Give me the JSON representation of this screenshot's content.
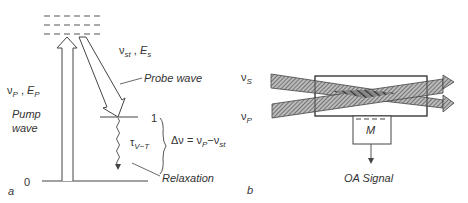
{
  "panel_a": {
    "panel_label": "a",
    "level_0": "0",
    "level_1": "1",
    "pump_symbol": "ν",
    "pump_symbol_sub": "P",
    "pump_energy": "E",
    "pump_energy_sub": "P",
    "pump_label_line1": "Pump",
    "pump_label_line2": "wave",
    "stokes_symbol": "ν",
    "stokes_symbol_sub": "st",
    "stokes_energy": "E",
    "stokes_energy_sub": "s",
    "probe_label": "Probe wave",
    "tau": "τ",
    "tau_sub": "V−T",
    "delta_nu": "Δν = ν",
    "delta_nu_sub1": "P",
    "delta_nu_mid": "−ν",
    "delta_nu_sub2": "st",
    "relaxation_label": "Relaxation"
  },
  "panel_b": {
    "panel_label": "b",
    "beam_s": "ν",
    "beam_s_sub": "S",
    "beam_p": "ν",
    "beam_p_sub": "P",
    "microphone": "M",
    "signal_label": "OA  Signal"
  }
}
